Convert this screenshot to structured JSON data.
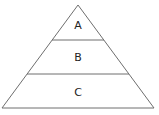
{
  "diagram": {
    "type": "pyramid",
    "levels": [
      {
        "label": "A",
        "position": "top"
      },
      {
        "label": "B",
        "position": "middle"
      },
      {
        "label": "C",
        "position": "bottom"
      }
    ],
    "colors": {
      "stroke": "#6e6e6e",
      "fill": "#ffffff",
      "text": "#222222"
    }
  }
}
